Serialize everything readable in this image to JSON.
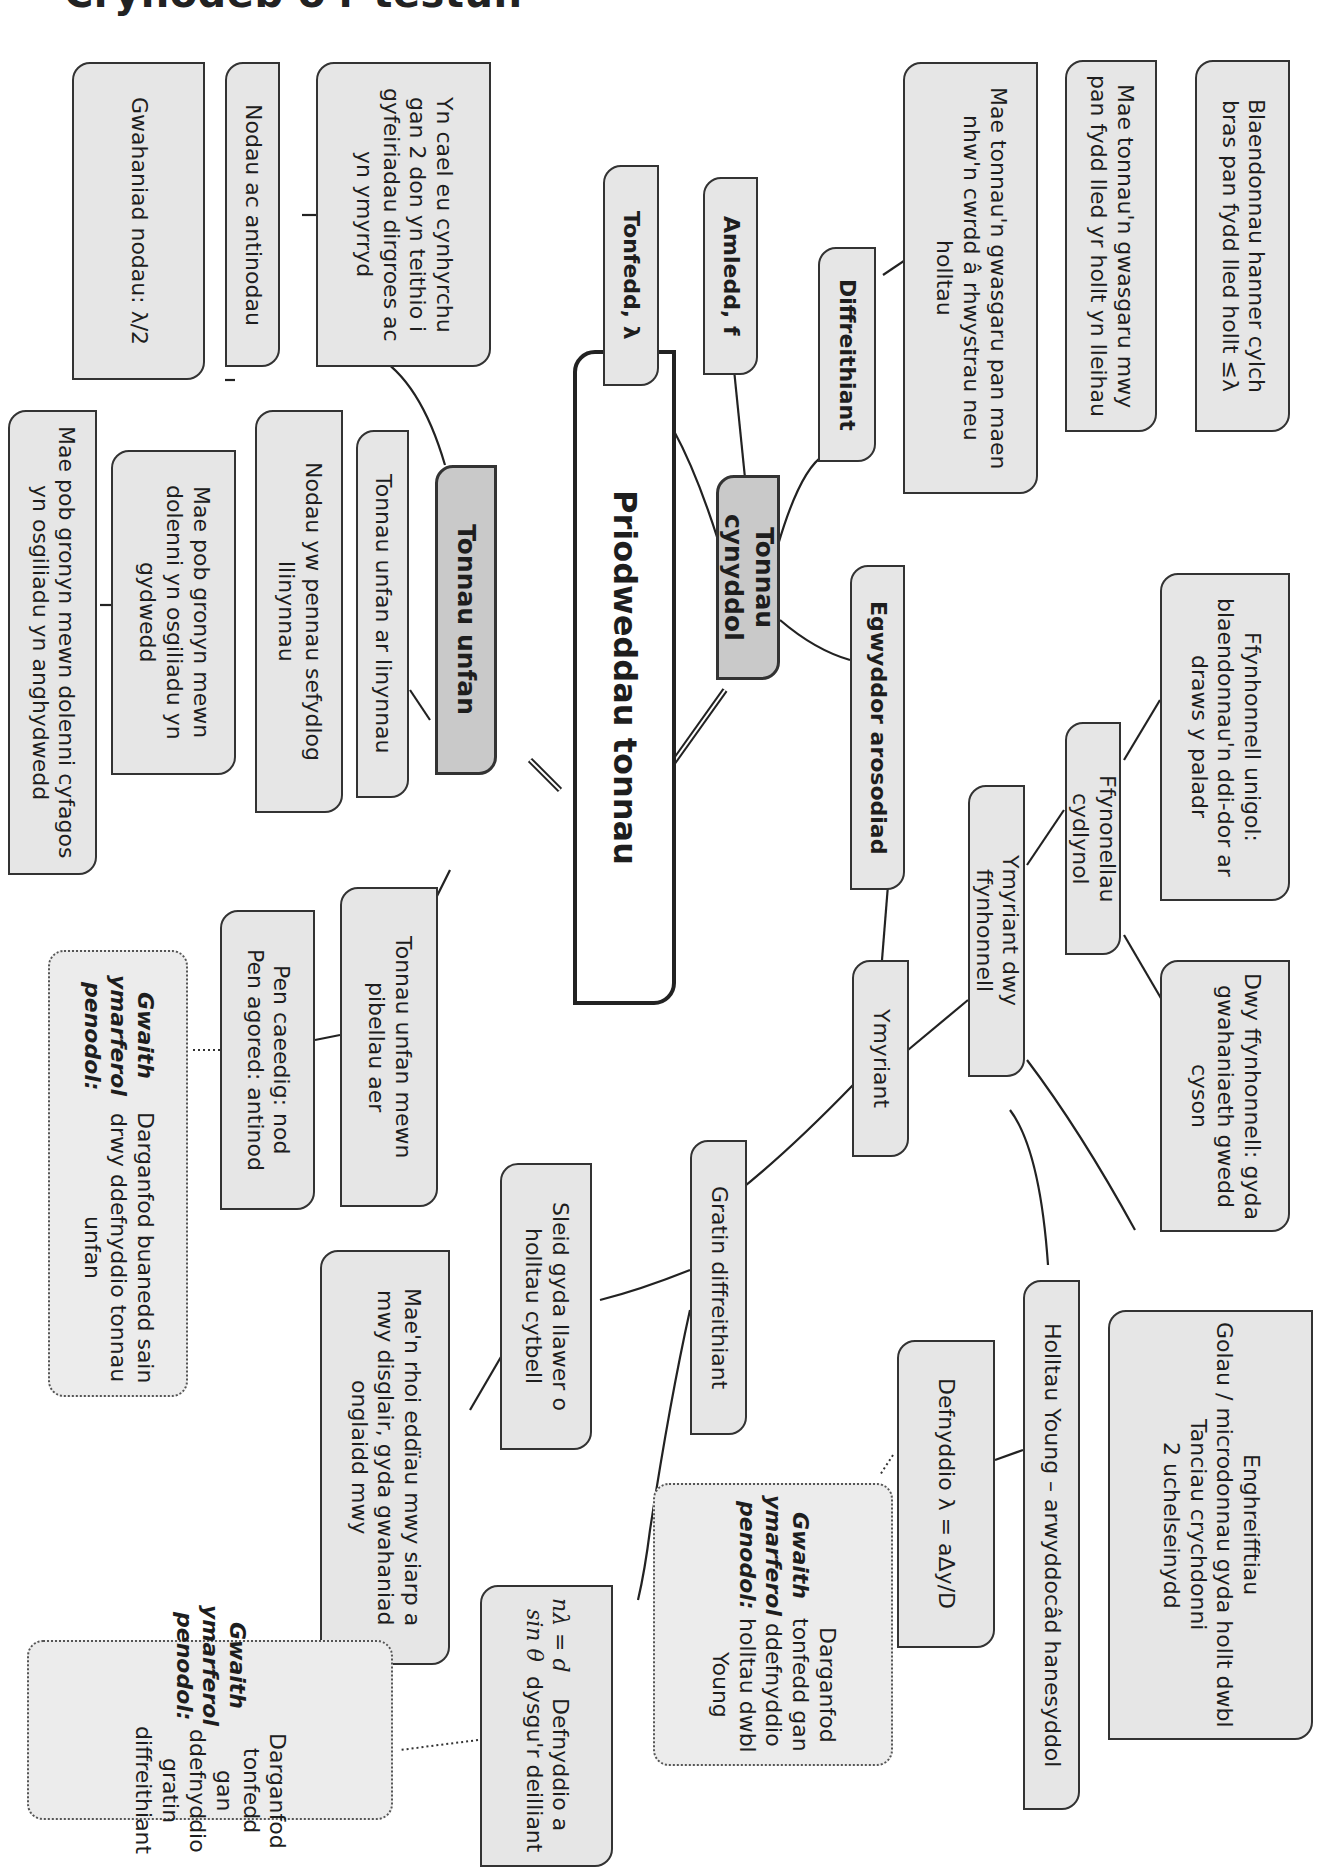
{
  "page_title": "Crynodeb o'r testun",
  "root": {
    "label": "Priodweddau tonnau"
  },
  "branches": {
    "tonnau_unfan": {
      "label": "Tonnau unfan",
      "cynhyrchu": "Yn cael eu cynhyrchu gan 2 don yn teithio i gyfeiriadau dirgroes ac yn ymyrryd",
      "nodau_antinodau": "Nodau ac antinodau",
      "gwahaniad_nodau": "Gwahaniad nodau: λ/2",
      "ar_linynnau": "Tonnau unfan ar linynnau",
      "nodau_pennau": "Nodau yw pennau sefydlog llinynnau",
      "gronyn_gydwedd": "Mae pob gronyn mewn dolenni yn osgiliadu yn gydwedd",
      "gronyn_anghydwedd": "Mae pob gronyn mewn dolenni cyfagos yn osgiliadu yn anghydwedd",
      "pibellau_aer": "Tonnau unfan mewn pibellau aer",
      "pennau": "Pen caeedig: nod\nPen agored: antinod",
      "practical": {
        "heading": "Gwaith ymarferol penodol:",
        "text": "Darganfod buanedd sain drwy ddefnyddio tonnau unfan"
      }
    },
    "tonnau_cynyddol": {
      "label": "Tonnau cynyddol",
      "tonfedd": "Tonfedd, λ",
      "amledd": "Amledd, f",
      "diffreithiant": "Diffreithiant",
      "gwasgaru_rhwystrau": "Mae tonnau'n gwasgaru pan maen nhw'n cwrdd â rhwystrau neu holltau",
      "gwasgaru_mwy": "Mae tonnau'n gwasgaru mwy pan fydd lled yr hollt yn lleihau",
      "blaendonnau": "Blaendonnau hanner cylch bras pan fydd lled hollt ≤λ"
    },
    "egwyddor_arosodiad": {
      "label": "Egwyddor arosodiad",
      "ymyriant": "Ymyriant",
      "ymyriant_dwy": "Ymyriant dwy ffynhonnell",
      "ffynonellau_cydlynol": "Ffynonellau cydlynol",
      "ffynhonnell_unigol": "Ffynhonnell unigol: blaendonnau'n ddi-dor ar draws y paladr",
      "dwy_ffynhonnell": "Dwy ffynhonnell: gyda gwahaniaeth gwedd cyson",
      "enghreifftiau": "Enghreifftiau\nGolau / microdonnau gyda hollt dwbl\nTanciau crychdonni\n2 uchelseinydd",
      "holltau_young": "Holltau Young – arwyddocâd hanesyddol",
      "defnyddio_young": "Defnyddio λ = aΔy/D",
      "practical_young": {
        "heading": "Gwaith ymarferol penodol:",
        "text": "Darganfod tonfedd gan ddefnyddio holltau dwbl Young"
      },
      "gratin": "Gratin diffreithiant",
      "sleid": "Sleid gyda llawer o holltau cytbell",
      "eddiau": "Mae'n rhoi eddïau mwy siarp a mwy disglair, gyda gwahaniad onglaidd mwy",
      "gratin_eq": "nλ = d sin θ",
      "gratin_text": "Defnyddio a dysgu'r deilliant",
      "practical_gratin": {
        "heading": "Gwaith ymarferol penodol:",
        "text": "Darganfod tonfedd gan ddefnyddio gratin diffreithiant"
      }
    }
  },
  "colors": {
    "box_fill": "#e6e6e6",
    "level1_fill": "#c9c9c9",
    "root_fill": "#ffffff",
    "line": "#222222"
  }
}
